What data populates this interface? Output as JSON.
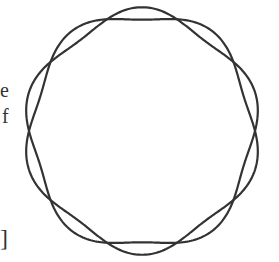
{
  "text_fragments": [
    "e",
    "f",
    "]"
  ],
  "diagram": {
    "type": "two interleaved wavy closed curves",
    "center": [
      142,
      131
    ],
    "radius": 113,
    "lobes": 5,
    "amplitude": 6,
    "stroke_color": "#333333"
  }
}
